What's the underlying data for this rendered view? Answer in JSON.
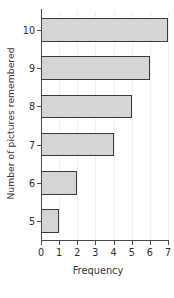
{
  "chart_data": {
    "type": "bar",
    "orientation": "horizontal",
    "title": "",
    "xlabel": "Frequency",
    "ylabel": "Number of pictures remembered",
    "categories": [
      "10",
      "9",
      "8",
      "7",
      "6",
      "5"
    ],
    "values": [
      7,
      6,
      5,
      4,
      2,
      1
    ],
    "series": [
      {
        "name": "Frequency",
        "values": [
          7,
          6,
          5,
          4,
          2,
          1
        ]
      }
    ],
    "x_tick_labels": [
      "0",
      "1",
      "2",
      "3",
      "4",
      "5",
      "6",
      "7"
    ],
    "x_ticks": [
      0,
      1,
      2,
      3,
      4,
      5,
      6,
      7
    ],
    "y_tick_labels": [
      "10",
      "9",
      "8",
      "7",
      "6",
      "5"
    ],
    "xlim": [
      0,
      7
    ],
    "grid": true,
    "grid_axis": "x",
    "legend": false,
    "legend_position": "none",
    "bar_fill_color": "#d5d5d5",
    "bar_edge_color": "#3a3a3a",
    "axis_color": "#4a4a4a",
    "grid_color": "#f0f0f0",
    "background_color": "#ffffff",
    "text_color": "#2b2b2b"
  }
}
